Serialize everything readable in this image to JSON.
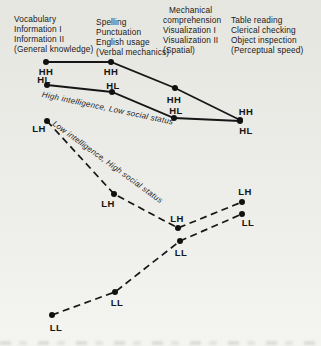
{
  "figure_columns": [
    {
      "x": 14,
      "y": 14,
      "indent_first": 0,
      "lines": [
        "Vocabulary",
        "Information I",
        "Information II",
        "(General knowledge)"
      ]
    },
    {
      "x": 96,
      "y": 17,
      "indent_first": 0,
      "lines": [
        "Spelling",
        "Punctuation",
        "English usage",
        "(Verbal mechanics)"
      ]
    },
    {
      "x": 163,
      "y": 5,
      "indent_first": 6,
      "lines": [
        "Mechanical",
        "comprehension",
        "Visualization I",
        "Visualization II",
        "(Spatial)"
      ]
    },
    {
      "x": 231,
      "y": 15,
      "indent_first": 0,
      "lines": [
        "Table reading",
        "Clerical checking",
        "Object inspection",
        "(Perceptual speed)"
      ]
    }
  ],
  "chart_data": {
    "type": "line",
    "categories": [
      "Vocabulary / Information I / Information II (General knowledge)",
      "Spelling / Punctuation / English usage (Verbal mechanics)",
      "Mechanical comprehension / Visualization I / Visualization II (Spatial)",
      "Table reading / Clerical checking / Object inspection (Perceptual speed)"
    ],
    "ylabel": "",
    "xlabel": "",
    "axes_shown": false,
    "series": [
      {
        "name": "HH",
        "line_style": "solid",
        "points": [
          {
            "x": 46,
            "y": 62,
            "lx": 46,
            "ly": 71
          },
          {
            "x": 111,
            "y": 62,
            "lx": 111,
            "ly": 71
          },
          {
            "x": 175,
            "y": 88,
            "lx": 174,
            "ly": 99
          },
          {
            "x": 240,
            "y": 120,
            "lx": 246,
            "ly": 111
          }
        ]
      },
      {
        "name": "HL",
        "line_style": "solid",
        "points": [
          {
            "x": 47,
            "y": 85,
            "lx": 44,
            "ly": 79
          },
          {
            "x": 112,
            "y": 92,
            "lx": 113,
            "ly": 85
          },
          {
            "x": 174,
            "y": 118,
            "lx": 176,
            "ly": 110
          },
          {
            "x": 240,
            "y": 121,
            "lx": 246,
            "ly": 130
          }
        ]
      },
      {
        "name": "LH",
        "line_style": "dashed",
        "points": [
          {
            "x": 47,
            "y": 121,
            "lx": 39,
            "ly": 128
          },
          {
            "x": 114,
            "y": 194,
            "lx": 108,
            "ly": 203
          },
          {
            "x": 178,
            "y": 228,
            "lx": 177,
            "ly": 218
          },
          {
            "x": 242,
            "y": 202,
            "lx": 245,
            "ly": 191
          }
        ]
      },
      {
        "name": "LL",
        "line_style": "dashed",
        "points": [
          {
            "x": 52,
            "y": 315,
            "lx": 56,
            "ly": 327
          },
          {
            "x": 115,
            "y": 292,
            "lx": 117,
            "ly": 302
          },
          {
            "x": 180,
            "y": 241,
            "lx": 181,
            "ly": 252
          },
          {
            "x": 242,
            "y": 214,
            "lx": 248,
            "ly": 222
          }
        ]
      }
    ],
    "annotations": [
      {
        "text": "High intelligence, Low social status",
        "x": 43,
        "y": 90,
        "angle": 12
      },
      {
        "text": "Low intelligence, High social status",
        "x": 56,
        "y": 119,
        "angle": 36
      }
    ],
    "colors": {
      "line": "#161616",
      "background": "#ebebe7",
      "text": "#1b1b1b"
    }
  }
}
